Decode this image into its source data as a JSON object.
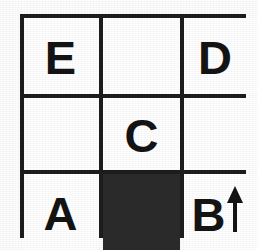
{
  "diagram": {
    "colors": {
      "background": "#fdfdfd",
      "cell_background": "#ffffff",
      "grid_line": "#1d1d1d",
      "filled_cell": "#2b2b2b",
      "letter": "#141414"
    },
    "grid": {
      "rows": 3,
      "columns": 3,
      "cells": [
        {
          "row": 1,
          "column": 1,
          "label": "E",
          "filled": false,
          "arrow": null
        },
        {
          "row": 1,
          "column": 2,
          "label": "",
          "filled": false,
          "arrow": null
        },
        {
          "row": 1,
          "column": 3,
          "label": "D",
          "filled": false,
          "arrow": null
        },
        {
          "row": 2,
          "column": 1,
          "label": "",
          "filled": false,
          "arrow": null
        },
        {
          "row": 2,
          "column": 2,
          "label": "C",
          "filled": false,
          "arrow": null
        },
        {
          "row": 2,
          "column": 3,
          "label": "",
          "filled": false,
          "arrow": null
        },
        {
          "row": 3,
          "column": 1,
          "label": "A",
          "filled": false,
          "arrow": null
        },
        {
          "row": 3,
          "column": 2,
          "label": "",
          "filled": true,
          "arrow": null
        },
        {
          "row": 3,
          "column": 3,
          "label": "B",
          "filled": false,
          "arrow": "arrow-up-icon"
        }
      ]
    }
  }
}
